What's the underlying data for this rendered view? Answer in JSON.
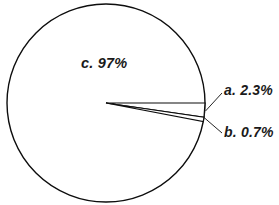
{
  "chart_data": {
    "type": "pie",
    "title": "",
    "categories": [
      "a.",
      "b.",
      "c."
    ],
    "values": [
      2.3,
      0.7,
      97
    ],
    "labels": [
      "a. 2.3%",
      "b. 0.7%",
      "c. 97%"
    ],
    "value_labels": [
      "2.3%",
      "0.7%",
      "97%"
    ],
    "legend": null,
    "grid": false,
    "slices": [
      {
        "key": "a",
        "label": "a. 2.3%",
        "value": 2.3,
        "start_angle_deg": 0,
        "end_angle_deg": 8.28,
        "fill": "#ffffff",
        "stroke": "#000000"
      },
      {
        "key": "b",
        "label": "b. 0.7%",
        "value": 0.7,
        "start_angle_deg": 8.28,
        "end_angle_deg": 10.8,
        "fill": "#ffffff",
        "stroke": "#000000"
      },
      {
        "key": "c",
        "label": "c. 97%",
        "value": 97,
        "start_angle_deg": 10.8,
        "end_angle_deg": 360,
        "fill": "#ffffff",
        "stroke": "#000000"
      }
    ]
  },
  "figure": {
    "background_color": "#ffffff",
    "outline_color": "#000000",
    "text_color": "#1a1a1a",
    "center_x": 106,
    "center_y": 103,
    "radius": 99
  },
  "labels": {
    "c": "c. 97%",
    "a": "a. 2.3%",
    "b": "b. 0.7%"
  }
}
